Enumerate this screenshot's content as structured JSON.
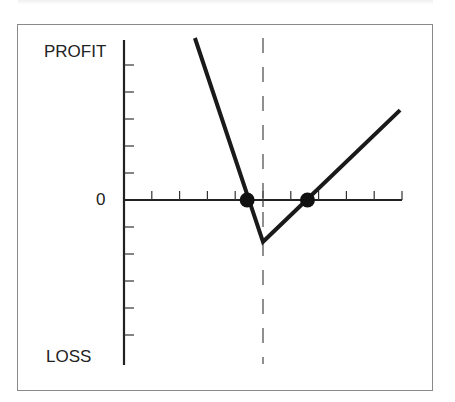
{
  "chart_data": {
    "type": "line",
    "title": "",
    "xlabel": "",
    "ylabel_top": "PROFIT",
    "ylabel_bottom": "LOSS",
    "zero_label": "0",
    "x_ticks": 10,
    "y_ticks_above_zero": 6,
    "y_ticks_below_zero": 6,
    "xlim": [
      0,
      10
    ],
    "ylim": [
      -6,
      6
    ],
    "grid": false,
    "legend": null,
    "series": [
      {
        "name": "payoff",
        "points": [
          [
            2.55,
            6.0
          ],
          [
            5.0,
            -1.55
          ],
          [
            9.93,
            3.33
          ]
        ],
        "color": "#1a1a1a"
      }
    ],
    "reference_lines": [
      {
        "type": "vertical-dashed",
        "x": 5.0,
        "color": "#555555"
      }
    ],
    "markers": [
      {
        "label": "breakeven-1",
        "x": 4.43,
        "y": 0
      },
      {
        "label": "breakeven-2",
        "x": 6.6,
        "y": 0
      }
    ]
  },
  "labels": {
    "profit": "PROFIT",
    "loss": "LOSS",
    "zero": "0"
  }
}
